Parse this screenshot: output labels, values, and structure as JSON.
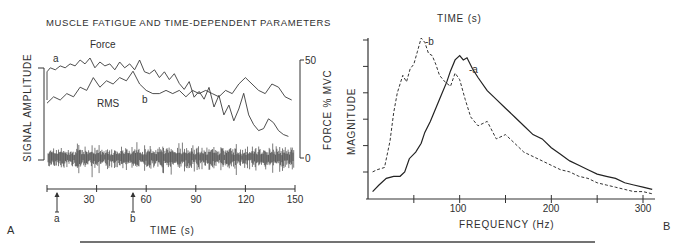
{
  "chart_data": [
    {
      "panel": "A",
      "type": "line",
      "title": "MUSCLE FATIGUE AND TIME-DEPENDENT PARAMETERS",
      "xlabel": "TIME (s)",
      "ylabel_left": "SIGNAL AMPLITUDE",
      "ylabel_right": "FORCE % MVC",
      "xlim": [
        0,
        150
      ],
      "ylim_right": [
        0,
        50
      ],
      "x_ticks": [
        30,
        60,
        90,
        120,
        150
      ],
      "y_ticks_right": [
        0,
        50
      ],
      "markers": [
        {
          "label": "a",
          "x": 4
        },
        {
          "label": "b",
          "x": 52
        }
      ],
      "series": [
        {
          "name": "Force",
          "unit": "% MVC",
          "x": [
            0,
            2,
            5,
            8,
            11,
            14,
            17,
            20,
            23,
            26,
            29,
            32,
            35,
            38,
            41,
            44,
            47,
            50,
            53,
            56,
            59,
            62,
            65,
            68,
            71,
            74,
            77,
            80,
            83,
            86,
            89,
            92,
            95,
            98,
            101,
            104,
            107,
            110,
            113,
            116,
            119,
            122,
            125,
            128,
            131,
            134,
            137,
            140,
            143,
            146
          ],
          "values": [
            44,
            46,
            45,
            47,
            46,
            48,
            47,
            50,
            48,
            51,
            46,
            49,
            47,
            48,
            45,
            49,
            46,
            48,
            45,
            50,
            44,
            43,
            45,
            41,
            44,
            40,
            43,
            38,
            35,
            39,
            31,
            34,
            30,
            36,
            26,
            32,
            22,
            27,
            19,
            25,
            33,
            22,
            17,
            14,
            15,
            20,
            18,
            14,
            12,
            11
          ]
        },
        {
          "name": "RMS",
          "unit": "a.u.",
          "x": [
            0,
            4,
            8,
            12,
            16,
            20,
            24,
            28,
            32,
            36,
            40,
            44,
            48,
            52,
            56,
            60,
            64,
            68,
            72,
            76,
            80,
            84,
            88,
            92,
            96,
            100,
            104,
            108,
            112,
            116,
            120,
            124,
            128,
            132,
            136,
            140,
            144,
            148
          ],
          "values": [
            14,
            16,
            15,
            17,
            16,
            19,
            18,
            22,
            19,
            21,
            20,
            22,
            21,
            24,
            20,
            18,
            17,
            17,
            18,
            17,
            18,
            16,
            18,
            17,
            18,
            17,
            16,
            18,
            17,
            20,
            22,
            20,
            18,
            17,
            20,
            19,
            16,
            15
          ]
        }
      ],
      "annotations": [
        "Force",
        "RMS",
        "a",
        "b"
      ],
      "raw_emg": "dense bipolar EMG interference pattern spanning 0–150 s"
    },
    {
      "panel": "B",
      "type": "line",
      "title": "TIME (s)",
      "xlabel": "FREQUENCY (Hz)",
      "ylabel": "MAGNITUDE",
      "xlim": [
        0,
        310
      ],
      "x_ticks": [
        50,
        100,
        150,
        200,
        250,
        300
      ],
      "x_tick_labels": [
        "",
        "100",
        "",
        "200",
        "",
        "300"
      ],
      "y_tick_count": 6,
      "grid": false,
      "series": [
        {
          "name": "a",
          "style": "solid",
          "x": [
            5,
            12,
            20,
            28,
            35,
            40,
            45,
            52,
            58,
            62,
            68,
            74,
            80,
            86,
            90,
            95,
            100,
            104,
            108,
            114,
            120,
            130,
            140,
            150,
            160,
            170,
            180,
            190,
            200,
            210,
            220,
            230,
            240,
            250,
            260,
            270,
            280,
            290,
            300,
            310
          ],
          "values": [
            2,
            5,
            8,
            9,
            9,
            11,
            17,
            20,
            24,
            29,
            34,
            40,
            46,
            52,
            57,
            62,
            64,
            62,
            63,
            58,
            54,
            48,
            44,
            40,
            36,
            32,
            28,
            26,
            22,
            19,
            16,
            14,
            12,
            10,
            9,
            8,
            6,
            5,
            4,
            3
          ]
        },
        {
          "name": "b",
          "style": "dashed",
          "x": [
            5,
            10,
            18,
            24,
            28,
            32,
            38,
            42,
            46,
            50,
            54,
            58,
            62,
            66,
            70,
            74,
            78,
            84,
            90,
            95,
            100,
            106,
            112,
            120,
            130,
            140,
            150,
            160,
            170,
            180,
            190,
            200,
            210,
            220,
            230,
            240,
            250,
            260,
            270,
            280,
            290,
            300,
            310
          ],
          "values": [
            11,
            12,
            13,
            25,
            38,
            47,
            55,
            52,
            58,
            60,
            66,
            72,
            70,
            65,
            64,
            60,
            55,
            52,
            50,
            56,
            53,
            44,
            36,
            32,
            34,
            26,
            28,
            24,
            20,
            18,
            16,
            14,
            12,
            11,
            9,
            8,
            6,
            5,
            4,
            3,
            2,
            2,
            1
          ]
        }
      ]
    }
  ],
  "labels": {
    "title_a": "MUSCLE FATIGUE AND TIME-DEPENDENT PARAMETERS",
    "force": "Force",
    "rms": "RMS",
    "mark_a": "a",
    "mark_b": "b",
    "signal_amplitude": "SIGNAL AMPLITUDE",
    "force_mvc": "FORCE % MVC",
    "right_50": "50",
    "right_0": "0",
    "time_axis": "TIME (s)",
    "panel_a": "A",
    "title_b": "TIME (s)",
    "magnitude": "MAGNITUDE",
    "freq_axis": "FREQUENCY (Hz)",
    "curve_a": "-a",
    "curve_b": "-b",
    "panel_b": "B",
    "tick_30": "30",
    "tick_60": "60",
    "tick_90": "90",
    "tick_120": "120",
    "tick_150": "150",
    "tick_100": "100",
    "tick_200": "200",
    "tick_300": "300"
  }
}
